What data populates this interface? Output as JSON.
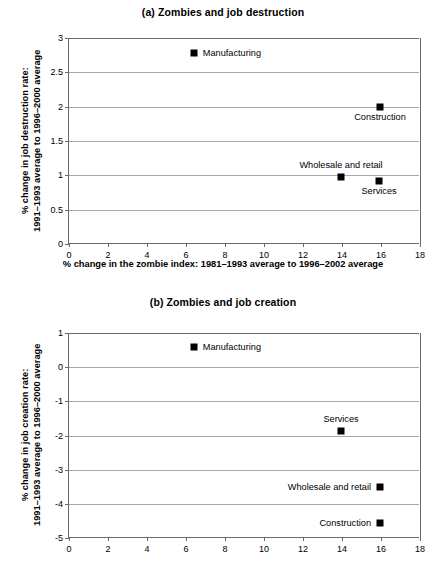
{
  "figure": {
    "background": "#ffffff",
    "marker_color": "#000000",
    "gridline_color": "#a9a9a9",
    "axis_color": "#6b6b6b"
  },
  "shared": {
    "xlabel": "% change in the zombie index: 1981–1993 average to 1996–2002 average",
    "xticks": [
      "0",
      "2",
      "4",
      "6",
      "8",
      "10",
      "12",
      "14",
      "16",
      "18"
    ]
  },
  "panel_a": {
    "title": "(a) Zombies and job destruction",
    "ylabel_line1": "% change in job destruction rate:",
    "ylabel_line2": "1991–1993 average to 1996–2000 average",
    "yticks": [
      "0",
      "0.5",
      "1",
      "1.5",
      "2",
      "2.5",
      "3"
    ],
    "points": [
      {
        "name": "Manufacturing",
        "label": "Manufacturing",
        "x": 6.4,
        "y": 2.78,
        "label_pos": "right"
      },
      {
        "name": "Construction",
        "label": "Construction",
        "x": 15.95,
        "y": 1.99,
        "label_pos": "below"
      },
      {
        "name": "Wholesale and retail",
        "label": "Wholesale and retail",
        "x": 13.95,
        "y": 0.97,
        "label_pos": "above"
      },
      {
        "name": "Services",
        "label": "Services",
        "x": 15.9,
        "y": 0.92,
        "label_pos": "below"
      }
    ]
  },
  "panel_b": {
    "title": "(b) Zombies and job creation",
    "ylabel_line1": "% change in job creation rate:",
    "ylabel_line2": "1991–1993 average to 1996–2000 average",
    "yticks": [
      "-5",
      "-4",
      "-3",
      "-2",
      "-1",
      "0",
      "1"
    ],
    "points": [
      {
        "name": "Manufacturing",
        "label": "Manufacturing",
        "x": 6.4,
        "y": 0.58,
        "label_pos": "right"
      },
      {
        "name": "Services",
        "label": "Services",
        "x": 13.95,
        "y": -1.88,
        "label_pos": "above"
      },
      {
        "name": "Wholesale and retail",
        "label": "Wholesale and retail",
        "x": 15.95,
        "y": -3.5,
        "label_pos": "left"
      },
      {
        "name": "Construction",
        "label": "Construction",
        "x": 15.95,
        "y": -4.55,
        "label_pos": "left"
      }
    ]
  },
  "chart_data": [
    {
      "type": "scatter",
      "title": "(a) Zombies and job destruction",
      "xlabel": "% change in the zombie index: 1981–1993 average to 1996–2002 average",
      "ylabel": "% change in job destruction rate: 1991–1993 average to 1996–2000 average",
      "xlim": [
        0,
        18
      ],
      "ylim": [
        0,
        3
      ],
      "xticks": [
        0,
        2,
        4,
        6,
        8,
        10,
        12,
        14,
        16,
        18
      ],
      "yticks": [
        0,
        0.5,
        1,
        1.5,
        2,
        2.5,
        3
      ],
      "grid": "horizontal",
      "legend": "none (points labeled inline)",
      "points": [
        {
          "label": "Manufacturing",
          "x": 6.4,
          "y": 2.78
        },
        {
          "label": "Construction",
          "x": 15.95,
          "y": 1.99
        },
        {
          "label": "Wholesale and retail",
          "x": 13.95,
          "y": 0.97
        },
        {
          "label": "Services",
          "x": 15.9,
          "y": 0.92
        }
      ]
    },
    {
      "type": "scatter",
      "title": "(b) Zombies and job creation",
      "xlabel": "% change in the zombie index: 1981–1993 average to 1996–2002 average",
      "ylabel": "% change in job creation rate: 1991–1993 average to 1996–2000 average",
      "xlim": [
        0,
        18
      ],
      "ylim": [
        -5,
        1
      ],
      "xticks": [
        0,
        2,
        4,
        6,
        8,
        10,
        12,
        14,
        16,
        18
      ],
      "yticks": [
        -5,
        -4,
        -3,
        -2,
        -1,
        0,
        1
      ],
      "grid": "horizontal",
      "legend": "none (points labeled inline)",
      "points": [
        {
          "label": "Manufacturing",
          "x": 6.4,
          "y": 0.58
        },
        {
          "label": "Services",
          "x": 13.95,
          "y": -1.88
        },
        {
          "label": "Wholesale and retail",
          "x": 15.95,
          "y": -3.5
        },
        {
          "label": "Construction",
          "x": 15.95,
          "y": -4.55
        }
      ]
    }
  ]
}
